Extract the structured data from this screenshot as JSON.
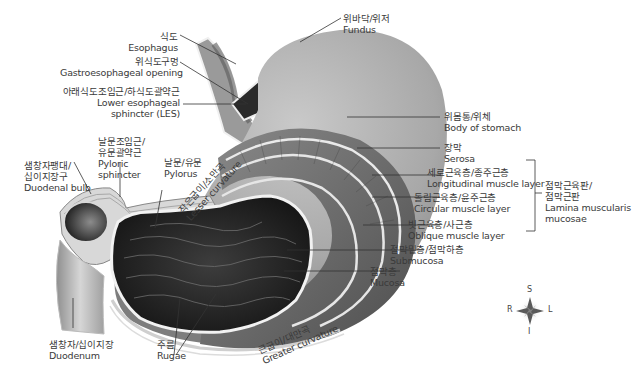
{
  "diagram": {
    "labels": {
      "esophagus": {
        "ko": "식도",
        "en": "Esophagus"
      },
      "ge_opening": {
        "ko": "위식도구멍",
        "en": "Gastroesophageal opening"
      },
      "les": {
        "ko": "아래식도조임근/하식도괄약근",
        "en1": "Lower esophageal",
        "en2": "sphincter (LES)"
      },
      "fundus": {
        "ko": "위바닥/위저",
        "en": "Fundus"
      },
      "body": {
        "ko": "위몸통/위체",
        "en": "Body of stomach"
      },
      "serosa": {
        "ko": "장막",
        "en": "Serosa"
      },
      "longitudinal": {
        "ko": "세로근육층/종주근층",
        "en": "Longitudinal muscle layer"
      },
      "circular": {
        "ko": "돌림근육층/윤주근층",
        "en": "Circular muscle layer"
      },
      "oblique": {
        "ko": "빗근육층/사근층",
        "en": "Oblique muscle layer"
      },
      "submucosa": {
        "ko": "점막밑층/점막하층",
        "en": "Submucosa"
      },
      "mucosa": {
        "ko": "점막층",
        "en": "Mucosa"
      },
      "lamina": {
        "ko1": "점막근육판/",
        "ko2": "점막근판",
        "en1": "Lamina muscularis",
        "en2": "mucosae"
      },
      "pyloric_sphincter": {
        "ko1": "날문조임근/",
        "ko2": "유문괄약근",
        "en1": "Pyloric",
        "en2": "sphincter"
      },
      "pylorus": {
        "ko": "날문/유문",
        "en": "Pylorus"
      },
      "lesser_curvature": {
        "ko": "작은굽이/소만곡",
        "en": "Lesser curvature"
      },
      "duodenal_bulb": {
        "ko1": "샘창자팽대/",
        "ko2": "십이지장구",
        "en": "Duodenal bulb"
      },
      "duodenum": {
        "ko": "샘창자/십이지장",
        "en": "Duodenum"
      },
      "rugae": {
        "ko": "주름",
        "en": "Rugae"
      },
      "greater_curvature": {
        "ko": "큰굽이/대만곡",
        "en": "Greater curvature"
      }
    },
    "compass": {
      "top": "S",
      "bottom": "I",
      "left": "R",
      "right": "L"
    },
    "colors": {
      "stomach_outer": "#a9a9a9",
      "muscle": "#6e6e6e",
      "lumen": "#2a2a2a",
      "leader": "#333333"
    }
  }
}
